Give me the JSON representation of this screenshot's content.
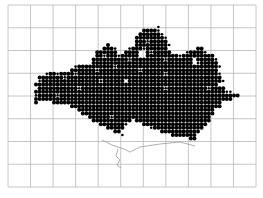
{
  "map": {
    "type": "dot-distribution-atlas",
    "background": "#ffffff",
    "grid": {
      "x0": 8,
      "y0": 5,
      "x1": 256,
      "y1": 187,
      "columns": 11,
      "rows": 8,
      "color": "#b8b8b8"
    },
    "dots": {
      "color": "#000000",
      "origin_x": 36,
      "origin_y": 27,
      "spacing": 3.6,
      "large_radius": 2.0,
      "small_radius": 1.3,
      "legend": {
        "L": "large dot",
        "s": "small dot",
        ".": "empty"
      },
      "rows": [
        "..................................s......................",
        "..............................LLLLs......................",
        ".............................LLLLLLs.....................",
        "............................LLLLLLLLs....................",
        "............................LLLsLLLLL....................",
        "....................L.......LLLLLLLLLs...................",
        "...................LLLs...sLLLsLLLLLL........LL..........",
        ".................LLLLLL..LLLL..LsLLLLL....sLLLLs.........",
        ".................LLsLLLsLLLLL..LLLLLLLLLsLLLLLLLLL.......",
        "................LLLLLLLLLLsLLLLLLLLLsLLLLLLL.LLLLLs......",
        "................LLLLLLLLLLLLLLLLLLLLLLLLLLLL.sLLLLL......",
        "...........sLLLLLLLLLLsLLLLLLLLLLLLLLLLLLLLLLLLLLLLs.....",
        "..........LLLLLLLsLLLLLLLLLLLsLLLLLLLLLLLLLLLLLLLLL.......",
        "...sLLsLLLLsLLLLLLLLLLLLLLLLLLLLLLLLsLLLLLLLLLLLLLLs......",
        ".LLLLLLLsLLLLLLLLLLLLLLLLLLLLLLLLLLLLLLLLLLLLLLLLLLL......",
        ".sLLLLLLLLLLLLLLLLsLLLLLL.LLLLLLLLLLLLLLLLLLLLLLLLLLs.....",
        "LLLLLLLLLLLLLLLLLLLLLLLLLLLLLLLLLLLLLLLLLLLLLLLLLLL......",
        ".LLLLLLLLLLLsLLLLLLLLLLLLLLLLLLLLLLLsLLLLLLLLLLLsLLLL.....",
        "LLLLLLLLLLLLLLLLLLLLLLLLLLLLLLLLLLLLLLLLLLLLLLLLLLLLLss...",
        "sLLLLLsLLLLLLLLLLLLLLLLLLLLLLLLLLLLLLLLLLLLLLLLLLLLLLLLLL",
        "LLLLLLLLLLLLLLLLLLLLLLLLLLLLLLLLLLLLLLLLLLLLLLLLLLLLLLL..",
        "L....LLLLLLLLLLLLLLLLLLLLLLLLLLLLLLLLLLLLLLLLLLLLLLL.....",
        "..........LLLLLLLLLLLLLLLLLLLLLLLLLLLLLLLLLLLLLLLLLL.....",
        "............LLLLLLLLLLLLLLLLLLLLLLLLLLLLLLLLLLLLLL.......",
        ".............LLLLLLLLLLLLLLLLLLLLLLLLLLLLLLLLLLLLL.......",
        "...............LLLLLLsLLLLLLLLLLLLLLLLLLLLLLLLLLL........",
        "................LLLLLLLLLLL.LLLLLLLLLLLLLLLLLLLLL........",
        "..................LLLLLLLs....LLLLLLLLLLLLLLLLLL.........",
        "....................LLLLL.......sLLLLLLLLLLLLLL..........",
        "......................LL...........LLLLLLLLLLL...........",
        "........................s.............LLLLLLL............",
        "...........................................LL............"
      ]
    },
    "coastline": {
      "color": "#9a9a9a",
      "path": "M 102 140 L 112 145 L 124 149 L 130 152 L 140 147 L 160 144 L 180 142 L 195 146 M 118 149 L 116 156 L 120 160 L 117 165 L 121 168"
    }
  }
}
